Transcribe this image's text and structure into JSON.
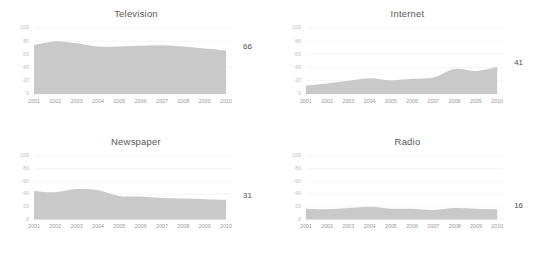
{
  "chart_data": [
    {
      "type": "area",
      "title": "Television",
      "xlabel": "",
      "ylabel": "",
      "x": [
        2001,
        2002,
        2003,
        2004,
        2005,
        2006,
        2007,
        2008,
        2009,
        2010
      ],
      "categories": [
        "2001",
        "2002",
        "2003",
        "2004",
        "2005",
        "2006",
        "2007",
        "2008",
        "2009",
        "2010"
      ],
      "values": [
        74,
        80,
        77,
        72,
        72,
        73,
        74,
        72,
        69,
        66
      ],
      "end_value_label": "66",
      "ylim": [
        0,
        100
      ],
      "yticks": [
        0,
        20,
        40,
        60,
        80,
        100
      ],
      "ytick_labels": [
        "0",
        "20",
        "40",
        "60",
        "80",
        "100"
      ],
      "grid": true,
      "legend": "none",
      "fill_color": "#c9c9c9"
    },
    {
      "type": "area",
      "title": "Internet",
      "xlabel": "",
      "ylabel": "",
      "x": [
        2001,
        2002,
        2003,
        2004,
        2005,
        2006,
        2007,
        2008,
        2009,
        2010
      ],
      "categories": [
        "2001",
        "2002",
        "2003",
        "2004",
        "2005",
        "2006",
        "2007",
        "2008",
        "2009",
        "2010"
      ],
      "values": [
        13,
        16,
        20,
        24,
        21,
        23,
        25,
        38,
        35,
        41
      ],
      "end_value_label": "41",
      "ylim": [
        0,
        100
      ],
      "yticks": [
        0,
        20,
        40,
        60,
        80,
        100
      ],
      "ytick_labels": [
        "0",
        "20",
        "40",
        "60",
        "80",
        "100"
      ],
      "grid": true,
      "legend": "none",
      "fill_color": "#c9c9c9"
    },
    {
      "type": "area",
      "title": "Newspaper",
      "xlabel": "",
      "ylabel": "",
      "x": [
        2001,
        2002,
        2003,
        2004,
        2005,
        2006,
        2007,
        2008,
        2009,
        2010
      ],
      "categories": [
        "2001",
        "2002",
        "2003",
        "2004",
        "2005",
        "2006",
        "2007",
        "2008",
        "2009",
        "2010"
      ],
      "values": [
        45,
        43,
        48,
        46,
        37,
        36,
        34,
        33,
        32,
        31
      ],
      "end_value_label": "31",
      "ylim": [
        0,
        100
      ],
      "yticks": [
        0,
        20,
        40,
        60,
        80,
        100
      ],
      "ytick_labels": [
        "0",
        "20",
        "40",
        "60",
        "80",
        "100"
      ],
      "grid": true,
      "legend": "none",
      "fill_color": "#c9c9c9"
    },
    {
      "type": "area",
      "title": "Radio",
      "xlabel": "",
      "ylabel": "",
      "x": [
        2001,
        2002,
        2003,
        2004,
        2005,
        2006,
        2007,
        2008,
        2009,
        2010
      ],
      "categories": [
        "2001",
        "2002",
        "2003",
        "2004",
        "2005",
        "2006",
        "2007",
        "2008",
        "2009",
        "2010"
      ],
      "values": [
        17,
        16,
        18,
        20,
        17,
        17,
        15,
        18,
        17,
        16
      ],
      "end_value_label": "16",
      "ylim": [
        0,
        100
      ],
      "yticks": [
        0,
        20,
        40,
        60,
        80,
        100
      ],
      "ytick_labels": [
        "0",
        "20",
        "40",
        "60",
        "80",
        "100"
      ],
      "grid": true,
      "legend": "none",
      "fill_color": "#c9c9c9"
    }
  ]
}
